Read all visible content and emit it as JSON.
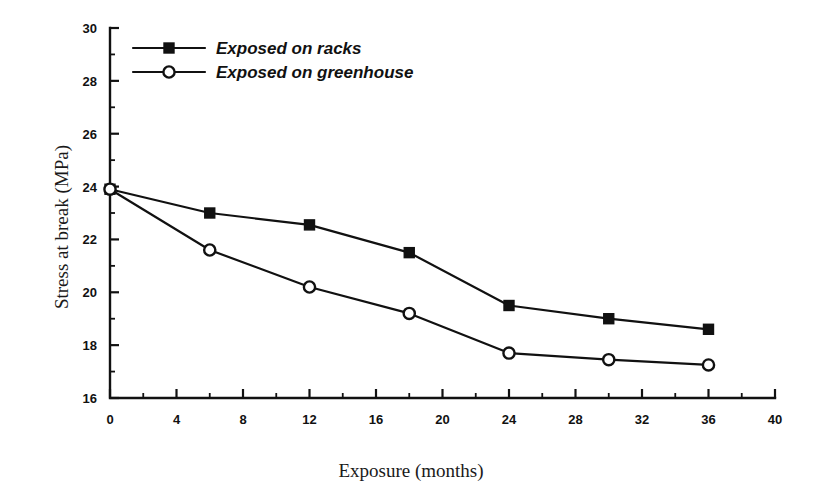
{
  "chart_data": {
    "type": "line",
    "title": "",
    "subtitle": "",
    "xlabel": "Exposure (months)",
    "ylabel": "Stress at break (MPa)",
    "xlim": [
      0,
      40
    ],
    "ylim": [
      16,
      30
    ],
    "x_major_ticks": [
      0,
      4,
      8,
      12,
      16,
      20,
      24,
      28,
      32,
      36,
      40
    ],
    "x_minor_step": 2,
    "y_major_ticks": [
      16,
      18,
      20,
      22,
      24,
      26,
      28,
      30
    ],
    "y_minor_step": 1,
    "grid": false,
    "legend_position": "top-left",
    "x": [
      0,
      6,
      12,
      18,
      24,
      30,
      36
    ],
    "series": [
      {
        "name": "Exposed on racks",
        "marker": "filled-square",
        "values": [
          23.9,
          23.0,
          22.55,
          21.5,
          19.5,
          19.0,
          18.6
        ]
      },
      {
        "name": "Exposed on greenhouse",
        "marker": "open-circle",
        "values": [
          23.9,
          21.6,
          20.2,
          19.2,
          17.7,
          17.45,
          17.25
        ]
      }
    ],
    "x_tick_labels": [
      "0",
      "4",
      "8",
      "12",
      "16",
      "20",
      "24",
      "28",
      "32",
      "36",
      "40"
    ],
    "y_tick_labels": [
      "16",
      "18",
      "20",
      "22",
      "24",
      "26",
      "28",
      "30"
    ],
    "colors": {
      "line": "#111111",
      "background": "#ffffff",
      "text": "#111111"
    }
  },
  "legend": {
    "entries": [
      {
        "label": "Exposed on racks"
      },
      {
        "label": "Exposed on greenhouse"
      }
    ]
  }
}
